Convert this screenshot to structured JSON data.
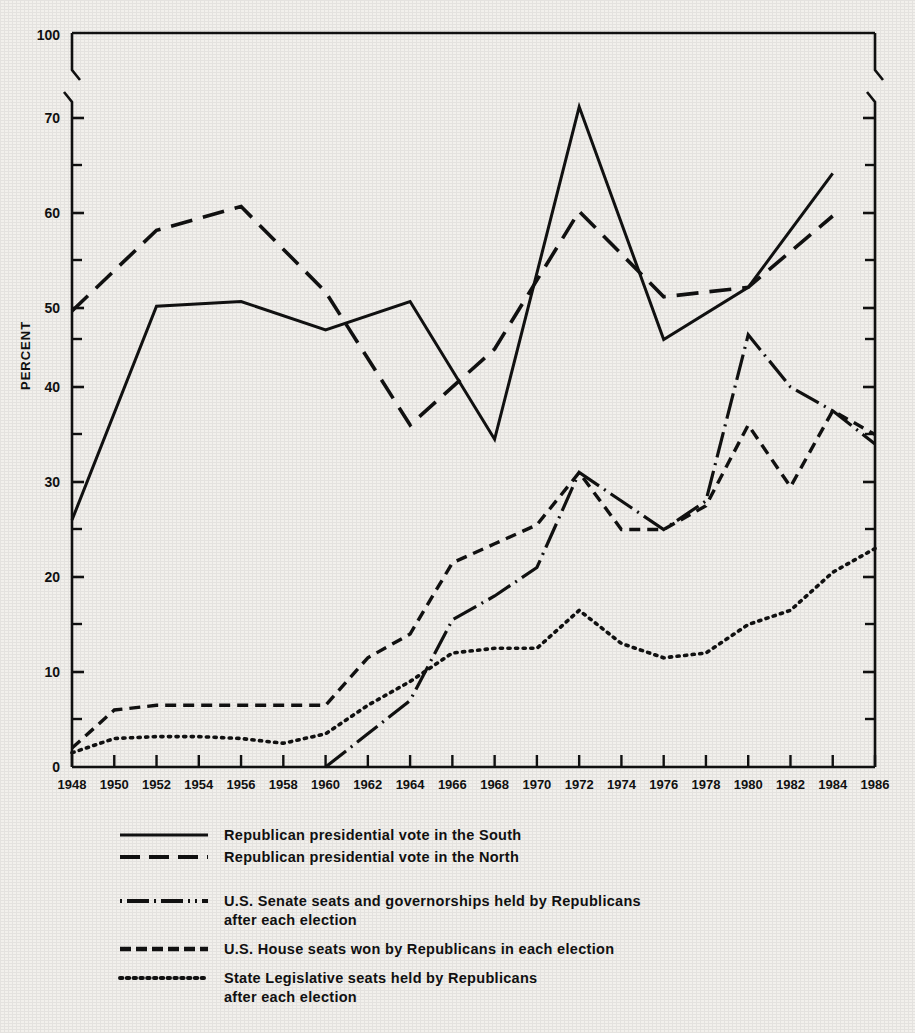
{
  "chart_data": {
    "type": "line",
    "title": "",
    "xlabel": "",
    "ylabel": "PERCENT",
    "xlim": [
      1948,
      1986
    ],
    "ylim": [
      0,
      100
    ],
    "y_axis_break": {
      "from": 70,
      "to": 100,
      "note": "axis broken between 70 and 100"
    },
    "grid": false,
    "legend_position": "below",
    "y_major_ticks": [
      0,
      10,
      20,
      30,
      40,
      50,
      60,
      70,
      100
    ],
    "y_minor_ticks": [
      5,
      15,
      25,
      35,
      45,
      55,
      65
    ],
    "x_tick_labels": [
      "1948",
      "1950",
      "1952",
      "1954",
      "1956",
      "1958",
      "1960",
      "1962",
      "1964",
      "1966",
      "1968",
      "1970",
      "1972",
      "1974",
      "1976",
      "1978",
      "1980",
      "1982",
      "1984",
      "1986"
    ],
    "series": [
      {
        "name": "Republican presidential vote in the South",
        "style": "solid",
        "x": [
          1948,
          1952,
          1956,
          1960,
          1964,
          1968,
          1972,
          1976,
          1980,
          1984
        ],
        "values": [
          26,
          48.5,
          49,
          46,
          49,
          34.5,
          69.5,
          45,
          50.5,
          62.5
        ]
      },
      {
        "name": "Republican presidential vote in the North",
        "style": "dashed",
        "x": [
          1948,
          1952,
          1956,
          1960,
          1964,
          1968,
          1972,
          1976,
          1980,
          1984
        ],
        "values": [
          48,
          56.5,
          59,
          50,
          36,
          44,
          58.5,
          49.5,
          50.5,
          58
        ]
      },
      {
        "name": "U.S. Senate seats and governorships held by Republicans after each election",
        "style": "dash-dot",
        "x": [
          1960,
          1962,
          1964,
          1966,
          1968,
          1970,
          1972,
          1974,
          1976,
          1978,
          1980,
          1982,
          1984,
          1986
        ],
        "values": [
          0,
          3.5,
          7,
          15.5,
          18,
          21,
          31,
          28,
          25,
          28,
          45.5,
          40,
          37.5,
          34
        ]
      },
      {
        "name": "U.S. House seats won by Republicans in each election",
        "style": "short-dash",
        "x": [
          1948,
          1950,
          1952,
          1954,
          1956,
          1958,
          1960,
          1962,
          1964,
          1966,
          1968,
          1970,
          1972,
          1974,
          1976,
          1978,
          1980,
          1982,
          1984,
          1986
        ],
        "values": [
          2,
          6,
          6.5,
          6.5,
          6.5,
          6.5,
          6.5,
          11.5,
          14,
          21.5,
          23.5,
          25.5,
          31,
          25,
          25,
          27.5,
          36,
          29.5,
          37.5,
          35
        ]
      },
      {
        "name": "State Legislative seats held by Republicans after each election",
        "style": "dotted",
        "x": [
          1948,
          1950,
          1952,
          1954,
          1956,
          1958,
          1960,
          1962,
          1964,
          1966,
          1968,
          1970,
          1972,
          1974,
          1976,
          1978,
          1980,
          1982,
          1984,
          1986
        ],
        "values": [
          1.5,
          3,
          3.2,
          3.2,
          3,
          2.5,
          3.5,
          6.5,
          9,
          12,
          12.5,
          12.5,
          16.5,
          13,
          11.5,
          12,
          15,
          16.5,
          20.5,
          23
        ]
      }
    ]
  },
  "axis": {
    "y_title": "PERCENT",
    "y_labels": [
      "100",
      "70",
      "60",
      "50",
      "40",
      "30",
      "20",
      "10",
      "0"
    ],
    "x_labels": [
      "1948",
      "1950",
      "1952",
      "1954",
      "1956",
      "1958",
      "1960",
      "1962",
      "1964",
      "1966",
      "1968",
      "1970",
      "1972",
      "1974",
      "1976",
      "1978",
      "1980",
      "1982",
      "1984",
      "1986"
    ]
  },
  "legend": {
    "entries": [
      {
        "swatch": "solid-line-icon",
        "label": "Republican presidential vote in the South"
      },
      {
        "swatch": "dashed-line-icon",
        "label": "Republican presidential vote in the North"
      },
      {
        "swatch": "dash-dot-line-icon",
        "label": "U.S. Senate seats and governorships held by Republicans\nafter each election"
      },
      {
        "swatch": "short-dash-line-icon",
        "label": "U.S. House seats won by Republicans in each election"
      },
      {
        "swatch": "dotted-line-icon",
        "label": "State Legislative seats held by Republicans\nafter each election"
      }
    ]
  },
  "colors": {
    "ink": "#111111",
    "paper": "#f2f0ec"
  }
}
